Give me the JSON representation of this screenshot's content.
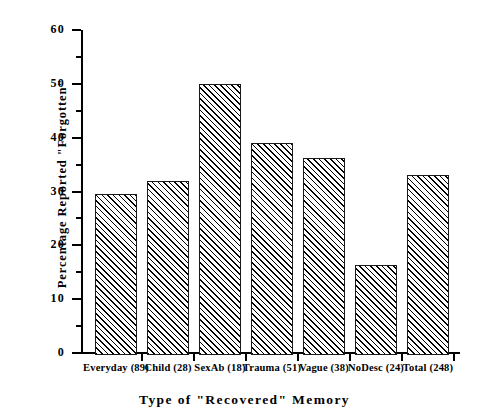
{
  "chart_data": {
    "type": "bar",
    "title": "",
    "xlabel": "Type of \"Recovered\" Memory",
    "ylabel": "Percentage Reported \"Forgotten\"",
    "categories": [
      "Everyday (89)",
      "Child (28)",
      "SexAb (18)",
      "Trauma (51)",
      "Vague (38)",
      "NoDesc (24)",
      "Total (248)"
    ],
    "values": [
      29.5,
      32.0,
      50.0,
      39.0,
      36.3,
      16.3,
      33.0
    ],
    "ylim": [
      0,
      60
    ],
    "xlim_note": "categorical",
    "y_major_ticks": [
      0,
      10,
      20,
      30,
      40,
      50,
      60
    ],
    "y_tick_labels": [
      "0",
      "10",
      "20",
      "30",
      "40",
      "50",
      "60"
    ],
    "y_minor_ticks": [
      5,
      15,
      25,
      35,
      45,
      55
    ],
    "grid": false,
    "legend": null,
    "bar_style": {
      "fill": "diagonal-hatch",
      "hatch_color": "#000000",
      "background": "#ffffff",
      "edge_color": "#1a1a1a"
    },
    "background_color": "#ffffff",
    "axes": {
      "top_spine": false,
      "right_spine": false,
      "left_spine": true,
      "bottom_spine": true,
      "tick_direction": "out"
    }
  }
}
